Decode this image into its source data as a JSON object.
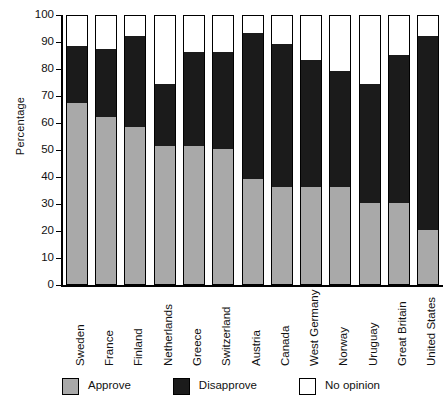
{
  "chart_data": {
    "type": "bar",
    "subtype": "stacked-bar",
    "title": "",
    "xlabel": "",
    "ylabel": "Percentage",
    "ylim": [
      0,
      100
    ],
    "yticks": [
      0,
      10,
      20,
      30,
      40,
      50,
      60,
      70,
      80,
      90,
      100
    ],
    "grid": false,
    "legend_position": "bottom",
    "categories": [
      "Sweden",
      "France",
      "Finland",
      "Netherlands",
      "Greece",
      "Switzerland",
      "Austria",
      "Canada",
      "West Germany",
      "Norway",
      "Uruguay",
      "Great Britain",
      "United States"
    ],
    "series": [
      {
        "name": "Approve",
        "color": "#a9a9a9",
        "values": [
          67,
          62,
          58,
          51,
          51,
          50,
          39,
          36,
          36,
          36,
          30,
          30,
          20
        ]
      },
      {
        "name": "Disapprove",
        "color": "#1b1b1b",
        "values": [
          21,
          25,
          34,
          23,
          35,
          36,
          54,
          53,
          47,
          43,
          44,
          55,
          72
        ]
      },
      {
        "name": "No opinion",
        "color": "#ffffff",
        "values": [
          12,
          13,
          8,
          26,
          14,
          14,
          7,
          11,
          17,
          21,
          26,
          15,
          8
        ]
      }
    ],
    "cumulative_tops": {
      "approve": [
        67,
        62,
        58,
        51,
        51,
        50,
        39,
        36,
        36,
        36,
        30,
        30,
        20
      ],
      "disapprove": [
        88,
        87,
        92,
        74,
        86,
        86,
        93,
        89,
        83,
        79,
        74,
        85,
        92
      ]
    }
  },
  "legend": {
    "items": [
      {
        "label": "Approve",
        "swatch": "approve-swatch"
      },
      {
        "label": "Disapprove",
        "swatch": "disapprove-swatch"
      },
      {
        "label": "No opinion",
        "swatch": "no-opinion-swatch"
      }
    ]
  },
  "colors": {
    "approve": "#a9a9a9",
    "disapprove": "#1b1b1b",
    "no_opinion": "#ffffff",
    "axis": "#000000",
    "text": "#111111"
  }
}
